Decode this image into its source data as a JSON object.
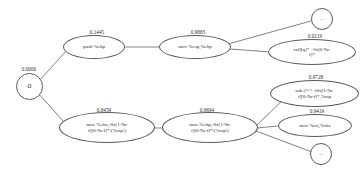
{
  "diagram": {
    "type": "probabilistic-prefix-tree",
    "background_color": "#ffffff",
    "stroke_color": "#4a4a4a",
    "text_color": "#2b2b2b",
    "nodes": [
      {
        "id": "root",
        "shape": "circle",
        "label": "Ø",
        "weight": "0.0000",
        "x": 16,
        "y": 73,
        "w": 27,
        "h": 27,
        "font_size": 5.4,
        "weight_x": 29,
        "weight_y": 66
      },
      {
        "id": "push-ebp",
        "shape": "ellipse",
        "label": "push %ebp",
        "weight": "0.1445",
        "x": 63,
        "y": 35,
        "w": 62,
        "h": 24,
        "font_size": 5.0,
        "weight_x": 97,
        "weight_y": 29
      },
      {
        "id": "mov-esp-ebp",
        "shape": "ellipse",
        "label": "mov %esp,%ebp",
        "weight": "0.9883",
        "x": 159,
        "y": 35,
        "w": 72,
        "h": 24,
        "font_size": 5.0,
        "weight_x": 198,
        "weight_y": 29
      },
      {
        "id": "ellipsis-top",
        "shape": "circle",
        "label": "...",
        "weight": "",
        "x": 311,
        "y": 8,
        "w": 22,
        "h": 22,
        "font_size": 4.6,
        "weight_x": 0,
        "weight_y": 0
      },
      {
        "id": "call-q",
        "shape": "ellipse",
        "label": "call[q]* +0x[0-9a-\nf]*",
        "weight": "0.0219",
        "x": 268,
        "y": 39,
        "w": 88,
        "h": 26,
        "font_size": 5.0,
        "weight_x": 315,
        "weight_y": 33
      },
      {
        "id": "mov-ebx",
        "shape": "ellipse",
        "label": "mov %ebx,-0x[1-9a-\nf][0-9a-f]*\\(%rsp\\)",
        "weight": "0.8459",
        "x": 59,
        "y": 112,
        "w": 96,
        "h": 31,
        "font_size": 5.0,
        "weight_x": 104,
        "weight_y": 107
      },
      {
        "id": "mov-ebp",
        "shape": "ellipse",
        "label": "mov %ebp,-0x[1-9a-\nf][0-9a-f]*\\(%rsp\\)",
        "weight": "0.9694",
        "x": 162,
        "y": 112,
        "w": 96,
        "h": 31,
        "font_size": 5.0,
        "weight_x": 207,
        "weight_y": 107
      },
      {
        "id": "sub-rsp",
        "shape": "ellipse",
        "label": "sub (?<! -)0x[1-9a-\nf][0-9a-f]*,%rsp",
        "weight": "0.9728",
        "x": 270,
        "y": 80,
        "w": 89,
        "h": 27,
        "font_size": 5.0,
        "weight_x": 316,
        "weight_y": 74
      },
      {
        "id": "mov-rsi-rbx",
        "shape": "ellipse",
        "label": "mov %rsi,%rbx",
        "weight": "0.9419",
        "x": 278,
        "y": 114,
        "w": 74,
        "h": 23,
        "font_size": 5.0,
        "weight_x": 317,
        "weight_y": 108
      },
      {
        "id": "ellipsis-bottom",
        "shape": "circle",
        "label": "...",
        "weight": "",
        "x": 310,
        "y": 143,
        "w": 22,
        "h": 22,
        "font_size": 4.6,
        "weight_x": 0,
        "weight_y": 0
      }
    ],
    "edges": [
      {
        "from": "root",
        "to": "push-ebp",
        "x1": 40,
        "y1": 80,
        "x2": 67,
        "y2": 50
      },
      {
        "from": "root",
        "to": "mov-ebx",
        "x1": 38,
        "y1": 93,
        "x2": 64,
        "y2": 122
      },
      {
        "from": "push-ebp",
        "to": "mov-esp-ebp",
        "x1": 125,
        "y1": 47,
        "x2": 159,
        "y2": 47
      },
      {
        "from": "mov-esp-ebp",
        "to": "ellipsis-top",
        "x1": 228,
        "y1": 44,
        "x2": 311,
        "y2": 21
      },
      {
        "from": "mov-esp-ebp",
        "to": "call-q",
        "x1": 230,
        "y1": 49,
        "x2": 270,
        "y2": 52
      },
      {
        "from": "mov-ebx",
        "to": "mov-ebp",
        "x1": 155,
        "y1": 128,
        "x2": 162,
        "y2": 128
      },
      {
        "from": "mov-ebp",
        "to": "sub-rsp",
        "x1": 256,
        "y1": 126,
        "x2": 288,
        "y2": 95
      },
      {
        "from": "mov-ebp",
        "to": "mov-rsi-rbx",
        "x1": 257,
        "y1": 128,
        "x2": 278,
        "y2": 126
      },
      {
        "from": "mov-ebp",
        "to": "ellipsis-bottom",
        "x1": 256,
        "y1": 131,
        "x2": 312,
        "y2": 152
      }
    ]
  }
}
